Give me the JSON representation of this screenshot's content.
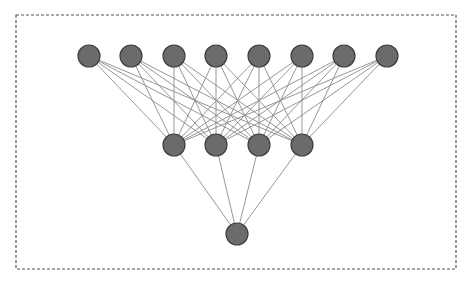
{
  "diagram": {
    "type": "neural-network",
    "frame": {
      "x": 16,
      "y": 15,
      "width": 440,
      "height": 254,
      "style": "dashed"
    },
    "colors": {
      "node_fill": "#6b6b6b",
      "node_stroke": "#3f3f3f",
      "edge": "#8a8a8a",
      "frame": "#555555",
      "background": "#ffffff"
    },
    "node_radius": 11,
    "layers": [
      {
        "name": "input",
        "y": 56,
        "x": [
          89,
          131,
          174,
          216,
          259,
          302,
          344,
          387
        ]
      },
      {
        "name": "hidden",
        "y": 145,
        "x": [
          174,
          216,
          259,
          302
        ]
      },
      {
        "name": "output",
        "y": 234,
        "x": [
          237
        ]
      }
    ],
    "connections": "fully-connected between adjacent layers"
  }
}
